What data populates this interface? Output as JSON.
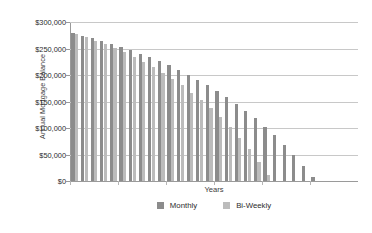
{
  "chart_data": {
    "type": "bar",
    "title": "",
    "subtitle": "",
    "xlabel": "Years",
    "ylabel": "Annual Mortgage Balance",
    "ylim": [
      0,
      300000
    ],
    "ytick_values": [
      300000,
      250000,
      200000,
      150000,
      100000,
      50000,
      0
    ],
    "ytick_labels": [
      "$300,000",
      "$250,000",
      "$200,000",
      "$150,000",
      "$100,000",
      "$50,000",
      "$0"
    ],
    "grid": true,
    "grid_axis": "y",
    "legend_position": "bottom-center",
    "bar_mode": "grouped",
    "categories": [
      1,
      2,
      3,
      4,
      5,
      6,
      7,
      8,
      9,
      10,
      11,
      12,
      13,
      14,
      15,
      16,
      17,
      18,
      19,
      20,
      21,
      22,
      23,
      24,
      25,
      26,
      27,
      28,
      29,
      30
    ],
    "series": [
      {
        "name": "Monthly",
        "color": "#8c8c8c",
        "values": [
          279000,
          274500,
          269500,
          264500,
          259000,
          253000,
          247000,
          240500,
          233500,
          226000,
          218000,
          209500,
          200500,
          191000,
          180500,
          169500,
          158000,
          145500,
          132000,
          118000,
          102500,
          86000,
          68500,
          49500,
          29000,
          7000,
          0,
          0,
          0,
          0
        ]
      },
      {
        "name": "Bi-Weekly",
        "color": "#bcbcbc",
        "values": [
          277500,
          271500,
          265000,
          258000,
          250500,
          242500,
          234000,
          225000,
          215000,
          204500,
          193000,
          180500,
          167000,
          152500,
          137000,
          120000,
          101500,
          81500,
          60000,
          36500,
          11500,
          0,
          0,
          0,
          0,
          0,
          0,
          0,
          0,
          0
        ]
      }
    ]
  },
  "legend": {
    "items": [
      {
        "label": "Monthly",
        "color": "#8c8c8c"
      },
      {
        "label": "Bi-Weekly",
        "color": "#bcbcbc"
      }
    ]
  },
  "axes": {
    "y_title": "Annual Mortgage Balance",
    "x_title": "Years"
  },
  "colors": {
    "monthly": "#8c8c8c",
    "biweekly": "#bcbcbc",
    "gridline": "#c8c8c8",
    "axis": "#9a9a9a",
    "background": "#ffffff",
    "text": "#2b2b2b"
  }
}
